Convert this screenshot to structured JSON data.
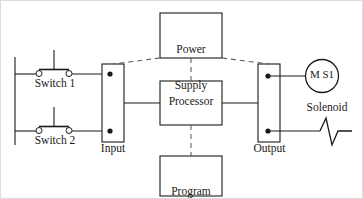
{
  "diagram": {
    "type": "block-schematic",
    "stroke_color": "#1a1a1a",
    "background_color": "#ffffff",
    "border_color": "#d8d8d8"
  },
  "blocks": {
    "power_supply": {
      "label_line1": "Power",
      "label_line2": "Supply"
    },
    "processor": {
      "label": "Processor"
    },
    "program_panel": {
      "label_line1": "Program",
      "label_line2": "Panel"
    },
    "input_module": {
      "label": "Input",
      "terminal_count": 2
    },
    "output_module": {
      "label": "Output",
      "terminal_count": 2
    }
  },
  "field_devices": {
    "switch_1": {
      "label": "Switch 1",
      "symbol": "normally-open-pushbutton"
    },
    "switch_2": {
      "label": "Switch 2",
      "symbol": "normally-open-pushbutton"
    },
    "motor": {
      "label": "M S1",
      "symbol": "motor-circle"
    },
    "solenoid": {
      "label": "Solenoid",
      "symbol": "coil-zigzag"
    }
  },
  "connections": {
    "power_supply_to_input": "dashed",
    "power_supply_to_output": "dashed",
    "power_supply_to_processor": "dashed",
    "program_panel_to_processor": "dashed",
    "input_to_processor": "solid",
    "processor_to_output": "solid",
    "switches_to_input": "solid",
    "output_to_loads": "solid"
  }
}
